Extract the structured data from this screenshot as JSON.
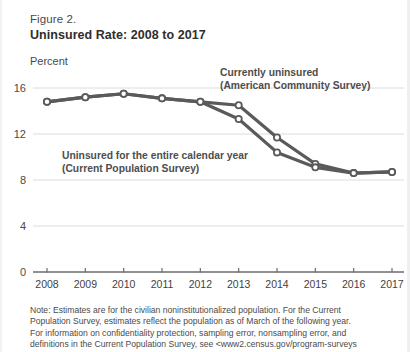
{
  "figure": {
    "label": "Figure 2.",
    "title": "Uninsured Rate: 2008 to 2017",
    "unit_label": "Percent"
  },
  "annotations": {
    "acs_line1": "Currently uninsured",
    "acs_line2": "(American Community Survey)",
    "cps_line1": "Uninsured for the entire calendar year",
    "cps_line2": "(Current Population Survey)"
  },
  "note": {
    "line1": "Note: Estimates are for the civilian noninstitutionalized population. For the Current",
    "line2": "Population Survey, estimates reflect the population as of March of the following year.",
    "line3": "For information on confidentiality protection, sampling error, nonsampling error, and",
    "line4": "definitions in the Current Population Survey, see <www2.census.gov/program-surveys"
  },
  "colors": {
    "line": "#5a5a5a",
    "grid": "#dcdcdc",
    "axis": "#6d6d6d",
    "marker_fill": "#ffffff",
    "text": "#4a4a4a"
  },
  "chart_data": {
    "type": "line",
    "title": "Uninsured Rate: 2008 to 2017",
    "xlabel": "",
    "ylabel": "Percent",
    "ylim": [
      0,
      16
    ],
    "yticks": [
      0,
      4,
      8,
      12,
      16
    ],
    "grid": true,
    "legend": "annotations-on-plot",
    "x": [
      2008,
      2009,
      2010,
      2011,
      2012,
      2013,
      2014,
      2015,
      2016,
      2017
    ],
    "series": [
      {
        "name": "Currently uninsured (American Community Survey)",
        "values": [
          14.8,
          15.2,
          15.5,
          15.1,
          14.8,
          14.5,
          11.7,
          9.4,
          8.6,
          8.7
        ]
      },
      {
        "name": "Uninsured for the entire calendar year (Current Population Survey)",
        "values": [
          14.8,
          15.2,
          15.5,
          15.1,
          14.8,
          13.3,
          10.4,
          9.1,
          8.6,
          8.7
        ]
      }
    ]
  }
}
